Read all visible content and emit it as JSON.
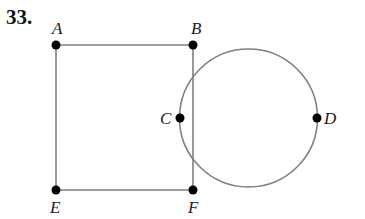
{
  "problem_number": "33.",
  "colors": {
    "line": "#808080",
    "point": "#000000",
    "text": "#1a1a1a"
  },
  "points": [
    {
      "id": "A",
      "label": "A",
      "x": 56,
      "y": 45,
      "lx": 52,
      "ly": 34
    },
    {
      "id": "B",
      "label": "B",
      "x": 193,
      "y": 45,
      "lx": 191,
      "ly": 34
    },
    {
      "id": "C",
      "label": "C",
      "x": 180,
      "y": 118,
      "lx": 160,
      "ly": 124
    },
    {
      "id": "D",
      "label": "D",
      "x": 317,
      "y": 118,
      "lx": 324,
      "ly": 124
    },
    {
      "id": "E",
      "label": "E",
      "x": 56,
      "y": 190,
      "lx": 50,
      "ly": 213
    },
    {
      "id": "F",
      "label": "F",
      "x": 193,
      "y": 190,
      "lx": 188,
      "ly": 213
    }
  ],
  "rectangle": {
    "vertices": [
      "A",
      "B",
      "F",
      "E"
    ]
  },
  "circle": {
    "cx": 248.5,
    "cy": 118,
    "r": 69,
    "through": [
      "C",
      "D"
    ]
  }
}
